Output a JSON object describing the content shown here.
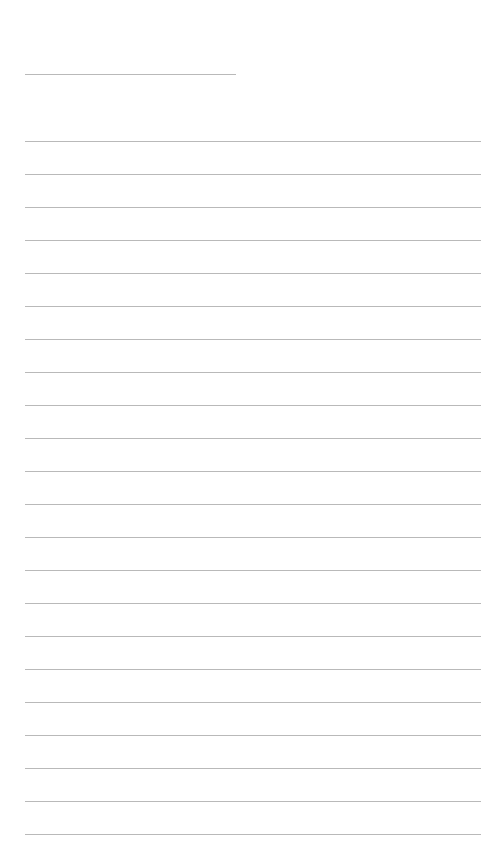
{
  "page": {
    "type": "blank lined sheet",
    "title_line": {
      "text": ""
    },
    "ruled_lines": [
      {
        "text": ""
      },
      {
        "text": ""
      },
      {
        "text": ""
      },
      {
        "text": ""
      },
      {
        "text": ""
      },
      {
        "text": ""
      },
      {
        "text": ""
      },
      {
        "text": ""
      },
      {
        "text": ""
      },
      {
        "text": ""
      },
      {
        "text": ""
      },
      {
        "text": ""
      },
      {
        "text": ""
      },
      {
        "text": ""
      },
      {
        "text": ""
      },
      {
        "text": ""
      },
      {
        "text": ""
      },
      {
        "text": ""
      },
      {
        "text": ""
      },
      {
        "text": ""
      },
      {
        "text": ""
      },
      {
        "text": ""
      }
    ],
    "line_color": "#b9b9b9",
    "background_color": "#ffffff"
  }
}
